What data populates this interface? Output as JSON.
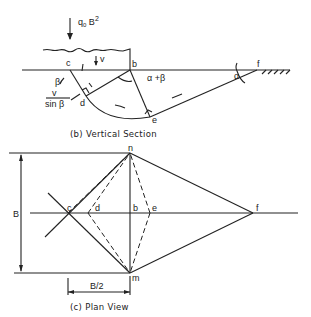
{
  "figure": {
    "vertical_section": {
      "caption": "(b)  Vertical Section",
      "load_label_base": "q",
      "load_label_sub": "0",
      "load_label_tail": " B",
      "load_label_sup": "2",
      "velocity_label": "v",
      "points": {
        "c": "c",
        "b": "b",
        "d": "d",
        "e": "e",
        "f": "f"
      },
      "angle_beta": "β",
      "angle_alpha_plus_beta": "α +β",
      "angle_alpha": "α",
      "velocity_ratio_num": "v",
      "velocity_ratio_den": "sin β"
    },
    "plan_view": {
      "caption": "(c)  Plan View",
      "dimension_B": "B",
      "dimension_half_B": "B/2",
      "points": {
        "n": "n",
        "m": "m",
        "c": "c",
        "d": "d",
        "b": "b",
        "e": "e",
        "f": "f"
      }
    }
  }
}
